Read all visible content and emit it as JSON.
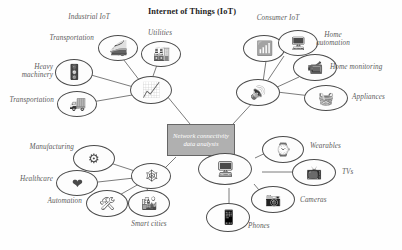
{
  "diagram": {
    "title": "Internet of Things (IoT)",
    "center_box": {
      "text": "Network connectivity data analysis",
      "fill_color": "#b0b0b0",
      "border_color": "#666666",
      "text_color": "#ffffff"
    },
    "group_labels": [
      {
        "id": "industrial-iot",
        "text": "Industrial IoT"
      },
      {
        "id": "consumer-iot",
        "text": "Consumer IoT"
      }
    ],
    "clusters": [
      {
        "id": "industrial-iot",
        "name": "Industrial IoT",
        "hub": {
          "id": "industrial-hub",
          "icon": "chart-trend-icon"
        },
        "nodes": [
          {
            "id": "transportation-rail",
            "label": "Transportation",
            "icon": "train-icon"
          },
          {
            "id": "utilities",
            "label": "Utilities",
            "icon": "factory-skyline-icon"
          },
          {
            "id": "heavy-machinery",
            "label": "Heavy\nmachinery",
            "icon": "traffic-signal-icon"
          },
          {
            "id": "transportation-truck",
            "label": "Transportation",
            "icon": "truck-icon"
          }
        ]
      },
      {
        "id": "consumer-iot",
        "name": "Consumer IoT",
        "hub": {
          "id": "consumer-hub",
          "icon": "smart-speaker-icon"
        },
        "nodes": [
          {
            "id": "wifi-router",
            "label": "",
            "icon": "wifi-router-icon"
          },
          {
            "id": "home-automation",
            "label": "Home\nautomation",
            "icon": "thermostat-icon"
          },
          {
            "id": "home-monitoring",
            "label": "Home monitoring",
            "icon": "security-camera-icon"
          },
          {
            "id": "appliances",
            "label": "Appliances",
            "icon": "appliances-icon"
          }
        ]
      },
      {
        "id": "industry-services",
        "name": "Industry services",
        "hub": {
          "id": "services-hub",
          "icon": "network-nodes-icon"
        },
        "nodes": [
          {
            "id": "manufacturing",
            "label": "Manufacturing",
            "icon": "assembly-line-icon"
          },
          {
            "id": "healthcare",
            "label": "Healthcare",
            "icon": "heart-icon"
          },
          {
            "id": "automation",
            "label": "Automation",
            "icon": "tools-icon"
          },
          {
            "id": "smart-cities",
            "label": "Smart cities",
            "icon": "cityscape-icon"
          }
        ]
      },
      {
        "id": "personal-devices",
        "name": "Personal devices",
        "hub": {
          "id": "devices-hub",
          "icon": "devices-collage-icon"
        },
        "nodes": [
          {
            "id": "wearables",
            "label": "Wearables",
            "icon": "smartwatch-icon"
          },
          {
            "id": "tvs",
            "label": "TVs",
            "icon": "television-icon"
          },
          {
            "id": "cameras",
            "label": "Cameras",
            "icon": "camera-icon"
          },
          {
            "id": "phones",
            "label": "Phones",
            "icon": "smartphone-icon"
          }
        ]
      }
    ]
  }
}
